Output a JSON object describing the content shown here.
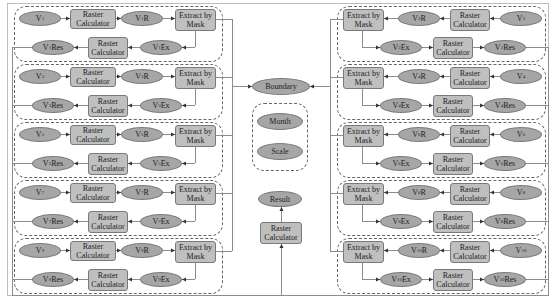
{
  "labels": {
    "raster_calculator": "Raster Calculator",
    "extract_by_mask": "Extract by Mask",
    "boundary": "Boundary",
    "month": "Month",
    "scale": "Scale",
    "result": "Result"
  },
  "left_groups": [
    {
      "input": "V1",
      "r": "V1R",
      "ex": "V1Ex",
      "res": "V1Res"
    },
    {
      "input": "V3",
      "r": "V3R",
      "ex": "V3Ex",
      "res": "V3Res"
    },
    {
      "input": "V5",
      "r": "V5R",
      "ex": "V5Ex",
      "res": "V5Res"
    },
    {
      "input": "V7",
      "r": "V7R",
      "ex": "V7Ex",
      "res": "V7Res"
    },
    {
      "input": "V9",
      "r": "V9R",
      "ex": "V9Ex",
      "res": "V9Res"
    }
  ],
  "right_groups": [
    {
      "input": "V2",
      "r": "V2R",
      "ex": "V2Ex",
      "res": "V2Res"
    },
    {
      "input": "V4",
      "r": "V4R",
      "ex": "V4Ex",
      "res": "V4Res"
    },
    {
      "input": "V6",
      "r": "V6R",
      "ex": "V6Ex",
      "res": "V6Res"
    },
    {
      "input": "V8",
      "r": "V8R",
      "ex": "V8Ex",
      "res": "V8Res"
    },
    {
      "input": "V10",
      "r": "V10R",
      "ex": "V10Ex",
      "res": "V10Res"
    }
  ],
  "colors": {
    "node_fill": "#a6a6a6",
    "tool_fill": "#bfbfbf",
    "param_fill": "#595959",
    "line": "#8c8c8c"
  }
}
